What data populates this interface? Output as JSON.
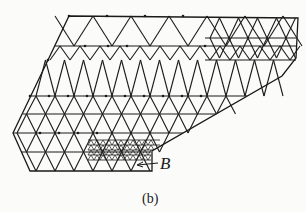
{
  "figure": {
    "label_B": "B",
    "caption": "(b)",
    "line_color": "#1a1a1a",
    "background": "#fbfbf9"
  },
  "mesh": {
    "outline": [
      [
        69,
        16
      ],
      [
        298,
        18
      ],
      [
        296,
        58
      ],
      [
        282,
        76
      ],
      [
        152,
        151
      ],
      [
        152,
        171
      ],
      [
        30,
        171
      ],
      [
        13,
        133
      ],
      [
        48,
        60
      ]
    ],
    "rows_y": [
      16,
      46,
      60,
      96,
      114,
      133,
      152,
      171
    ],
    "fine_region": {
      "x0": 88,
      "x1": 152,
      "y0": 140,
      "y1": 160
    }
  }
}
